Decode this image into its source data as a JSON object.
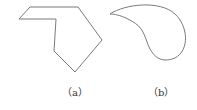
{
  "figure": {
    "stroke_color": "#7a7a7a",
    "shapes": [
      {
        "id": "a",
        "type": "polygon",
        "label": "（a）",
        "points": [
          [
            19,
            19
          ],
          [
            30,
            7
          ],
          [
            78,
            7
          ],
          [
            102,
            40
          ],
          [
            75,
            72
          ],
          [
            54,
            51
          ],
          [
            56,
            19
          ]
        ]
      },
      {
        "id": "b",
        "type": "closed-curve",
        "label": "（b）",
        "path": "M110,14 C125,4 160,0 175,14 C188,26 190,50 175,58 C160,64 152,56 147,42 C143,30 140,25 128,19 C120,15 114,14 110,14 Z"
      }
    ]
  }
}
